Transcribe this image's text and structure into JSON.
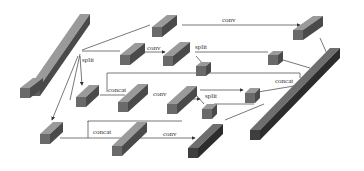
{
  "diagram": {
    "type": "network-architecture",
    "colors": {
      "block_front": "#6a6a6a",
      "block_top": "#9a9a9a",
      "block_side": "#4a4a4a",
      "dark_front": "#3e3e3e",
      "dark_top": "#6e6e6e",
      "dark_side": "#2c2c2c",
      "line": "#555555",
      "background": "#ffffff"
    },
    "labels": {
      "split_1": "split",
      "conv_top": "conv",
      "conv_2": "conv",
      "split_2": "split",
      "concat_1": "concat",
      "conv_3": "conv",
      "split_3": "split",
      "concat_right": "concat",
      "concat_bottom": "concat",
      "conv_bottom": "conv"
    }
  }
}
